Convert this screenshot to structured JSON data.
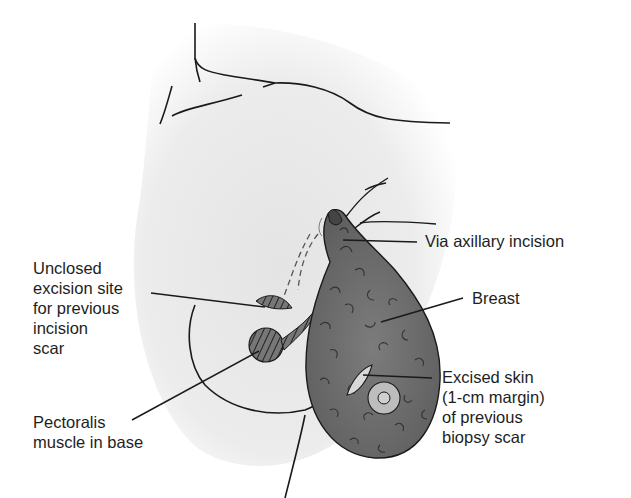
{
  "figure": {
    "colors": {
      "background": "#ffffff",
      "skin_shade": "#e9e9e9",
      "tissue": "#6f6f6f",
      "outline": "#1a1a1a",
      "text": "#1e1e1e"
    }
  },
  "labels": {
    "unclosed_excision_site": "Unclosed\nexcision site\nfor previous\nincision\nscar",
    "via_axillary_incision": "Via axillary incision",
    "breast": "Breast",
    "excised_skin": "Excised skin\n(1-cm margin)\nof previous\nbiopsy scar",
    "pectoralis_muscle": "Pectoralis\nmuscle in base"
  }
}
